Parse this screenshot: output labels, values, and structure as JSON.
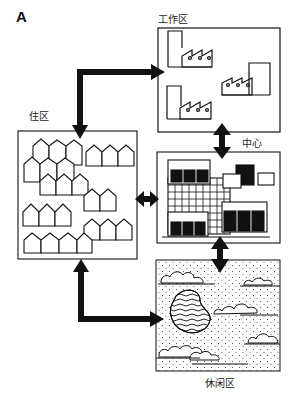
{
  "figure": {
    "panel_label": "A",
    "zones": {
      "work": {
        "label": "工作区"
      },
      "center": {
        "label": "中心"
      },
      "residential": {
        "label": "住区"
      },
      "leisure": {
        "label": "休闲区"
      }
    },
    "connections": [
      {
        "from": "residential",
        "to": "work",
        "type": "bidirectional"
      },
      {
        "from": "residential",
        "to": "center",
        "type": "bidirectional"
      },
      {
        "from": "residential",
        "to": "leisure",
        "type": "bidirectional"
      },
      {
        "from": "work",
        "to": "center",
        "type": "bidirectional"
      },
      {
        "from": "center",
        "to": "leisure",
        "type": "bidirectional"
      }
    ],
    "colors": {
      "ink": "#111111",
      "background": "#ffffff"
    }
  }
}
